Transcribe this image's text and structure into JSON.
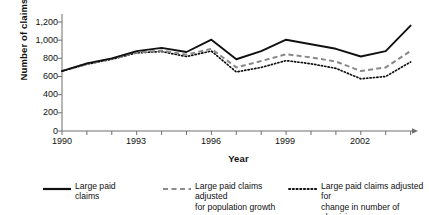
{
  "chart_data": {
    "type": "line",
    "title": "",
    "xlabel": "Year",
    "ylabel": "Number of claims",
    "x": [
      1990,
      1991,
      1992,
      1993,
      1994,
      1995,
      1996,
      1997,
      1998,
      1999,
      2000,
      2001,
      2002,
      2003,
      2004
    ],
    "xlim": [
      1990,
      2004
    ],
    "ylim": [
      0,
      1200
    ],
    "xticks": [
      1990,
      1993,
      1996,
      1999,
      2002
    ],
    "xtick_labels": [
      "1990",
      "1993",
      "1996",
      "1999",
      "2002"
    ],
    "yticks": [
      0,
      200,
      400,
      600,
      800,
      1000,
      1200
    ],
    "ytick_labels": [
      "0",
      "200",
      "400",
      "600",
      "800",
      "1,000",
      "1,200"
    ],
    "grid": false,
    "legend_position": "below",
    "series": [
      {
        "name": "Large paid claims",
        "style": "solid",
        "color": "#111111",
        "values": [
          660,
          745,
          800,
          880,
          915,
          870,
          1005,
          790,
          880,
          1005,
          955,
          905,
          820,
          880,
          1160
        ]
      },
      {
        "name": "Large paid claims adjusted for population growth",
        "style": "dashed",
        "color": "#888888",
        "values": [
          660,
          740,
          795,
          865,
          885,
          840,
          905,
          700,
          770,
          845,
          810,
          765,
          660,
          700,
          880
        ]
      },
      {
        "name": "Large paid claims adjusted for change in number of physicians",
        "style": "dotted",
        "color": "#111111",
        "values": [
          660,
          735,
          790,
          860,
          875,
          820,
          880,
          650,
          700,
          775,
          740,
          690,
          575,
          600,
          760
        ]
      }
    ]
  },
  "legend": {
    "items": [
      {
        "label_line1": "Large paid",
        "label_line2": "claims",
        "swatch": "solid-line-swatch"
      },
      {
        "label_line1": "Large paid claims adjusted",
        "label_line2": "for population growth",
        "swatch": "dashed-line-swatch"
      },
      {
        "label_line1": "Large paid claims adjusted for",
        "label_line2": "change in number of physicians",
        "swatch": "dotted-line-swatch"
      }
    ]
  }
}
